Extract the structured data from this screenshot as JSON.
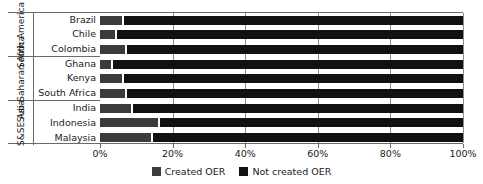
{
  "top_clip_text": "",
  "chart_data": {
    "type": "bar",
    "orientation": "horizontal",
    "stacked": true,
    "stack_mode": "percent",
    "title": "",
    "subtitle": "",
    "xlabel": "",
    "ylabel": "",
    "xlim": [
      0,
      100
    ],
    "xticks": [
      0,
      20,
      40,
      60,
      80,
      100
    ],
    "xtick_labels": [
      "0%",
      "20%",
      "40%",
      "60%",
      "80%",
      "100%"
    ],
    "grid": true,
    "grid_axis": "x",
    "legend_position": "bottom",
    "categories": [
      "Brazil",
      "Chile",
      "Colombia",
      "Ghana",
      "Kenya",
      "South Africa",
      "India",
      "Indonesia",
      "Malaysia"
    ],
    "groups": [
      {
        "label": "South America",
        "categories": [
          "Brazil",
          "Chile",
          "Colombia"
        ]
      },
      {
        "label": "Sub-Saharan Africa",
        "categories": [
          "Ghana",
          "Kenya",
          "South Africa"
        ]
      },
      {
        "label": "S&SE Asia",
        "categories": [
          "India",
          "Indonesia",
          "Malaysia"
        ]
      }
    ],
    "series": [
      {
        "name": "Created OER",
        "color": "#3b3b3b",
        "values": [
          6,
          4,
          7,
          3,
          6,
          7,
          8.5,
          16,
          14
        ]
      },
      {
        "name": "Not created OER",
        "color": "#111111",
        "values": [
          94,
          96,
          93,
          97,
          94,
          93,
          91.5,
          84,
          86
        ]
      }
    ],
    "legend": [
      {
        "label": "Created OER",
        "color": "#3b3b3b"
      },
      {
        "label": "Not created OER",
        "color": "#111111"
      }
    ]
  }
}
